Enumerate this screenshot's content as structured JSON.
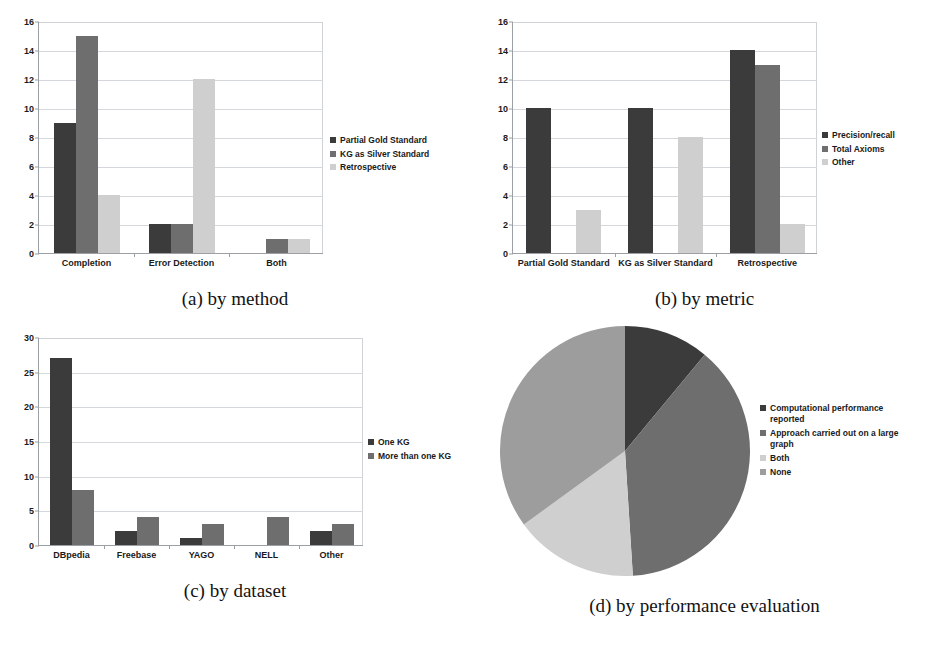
{
  "figure": {
    "panels": [
      {
        "key": "a",
        "caption": "(a) by method"
      },
      {
        "key": "b",
        "caption": "(b) by metric"
      },
      {
        "key": "c",
        "caption": "(c) by dataset"
      },
      {
        "key": "d",
        "caption": "(d) by performance evaluation"
      }
    ]
  },
  "colors": {
    "dark": "#3b3b3b",
    "mid": "#6e6e6e",
    "light": "#cfcfcf",
    "pie_dark": "#3b3b3b",
    "pie_mid": "#6e6e6e",
    "pie_light": "#cfcfcf",
    "pie_midlight": "#9d9d9d",
    "axis": "#9aa0a6",
    "grid": "#d4d8dc",
    "text": "#1a1a1a"
  },
  "chart_data": [
    {
      "id": "a",
      "type": "bar",
      "title": "(a) by method",
      "xlabel": "",
      "ylabel": "",
      "ylim": [
        0,
        16
      ],
      "yticks": [
        0,
        2,
        4,
        6,
        8,
        10,
        12,
        14,
        16
      ],
      "grid": true,
      "legend_position": "right",
      "categories": [
        "Completion",
        "Error Detection",
        "Both"
      ],
      "series": [
        {
          "name": "Partial Gold Standard",
          "values": [
            9,
            2,
            0
          ]
        },
        {
          "name": "KG as Silver Standard",
          "values": [
            15,
            2,
            1
          ]
        },
        {
          "name": "Retrospective",
          "values": [
            4,
            12,
            1
          ]
        }
      ]
    },
    {
      "id": "b",
      "type": "bar",
      "title": "(b) by metric",
      "xlabel": "",
      "ylabel": "",
      "ylim": [
        0,
        16
      ],
      "yticks": [
        0,
        2,
        4,
        6,
        8,
        10,
        12,
        14,
        16
      ],
      "grid": true,
      "legend_position": "right",
      "categories": [
        "Partial Gold Standard",
        "KG as Silver Standard",
        "Retrospective"
      ],
      "series": [
        {
          "name": "Precision/recall",
          "values": [
            10,
            10,
            14
          ]
        },
        {
          "name": "Total Axioms",
          "values": [
            0,
            0,
            13
          ]
        },
        {
          "name": "Other",
          "values": [
            3,
            8,
            2
          ]
        }
      ]
    },
    {
      "id": "c",
      "type": "bar",
      "title": "(c) by dataset",
      "xlabel": "",
      "ylabel": "",
      "ylim": [
        0,
        30
      ],
      "yticks": [
        0,
        5,
        10,
        15,
        20,
        25,
        30
      ],
      "grid": true,
      "legend_position": "right",
      "categories": [
        "DBpedia",
        "Freebase",
        "YAGO",
        "NELL",
        "Other"
      ],
      "series": [
        {
          "name": "One KG",
          "values": [
            27,
            2,
            1,
            0,
            2
          ]
        },
        {
          "name": "More than one KG",
          "values": [
            8,
            4,
            3,
            4,
            3
          ]
        }
      ]
    },
    {
      "id": "d",
      "type": "pie",
      "title": "(d) by performance evaluation",
      "legend_position": "right",
      "labels": [
        "Computational performance\nreported",
        "Approach carried out on a large\ngraph",
        "Both",
        "None"
      ],
      "values": [
        11,
        38,
        16,
        35
      ],
      "start_angle_deg": 0,
      "direction": "clockwise"
    }
  ]
}
